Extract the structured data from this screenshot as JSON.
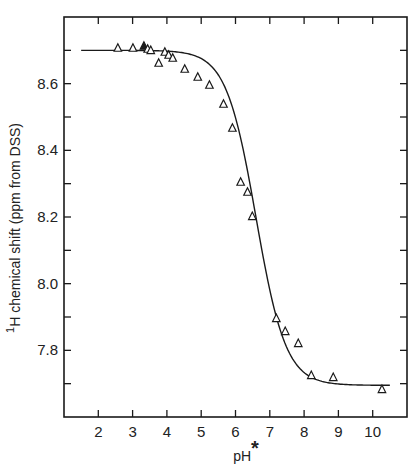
{
  "chart_data": {
    "type": "scatter",
    "title": "",
    "xlabel": "pH",
    "xlabel_superscript": "*",
    "ylabel": "H chemical shift (ppm from DSS)",
    "ylabel_superscript": "1",
    "xlim": [
      1.0,
      11.0
    ],
    "ylim": [
      7.6,
      8.8
    ],
    "x_ticks": [
      2,
      3,
      4,
      5,
      6,
      7,
      8,
      9,
      10
    ],
    "x_tick_labels": [
      "2",
      "3",
      "4",
      "5",
      "6",
      "7",
      "8",
      "9",
      "10"
    ],
    "y_ticks": [
      7.8,
      8.0,
      8.2,
      8.4,
      8.6
    ],
    "y_tick_labels": [
      "7.8",
      "8.0",
      "8.2",
      "8.4",
      "8.6"
    ],
    "y_minor_step": 0.1,
    "grid": false,
    "legend": null,
    "marker": "open-triangle",
    "series": [
      {
        "name": "observed",
        "points": [
          {
            "x": 2.57,
            "y": 8.707
          },
          {
            "x": 3.01,
            "y": 8.707
          },
          {
            "x": 3.33,
            "y": 8.713,
            "filled": true
          },
          {
            "x": 3.44,
            "y": 8.704
          },
          {
            "x": 3.53,
            "y": 8.7
          },
          {
            "x": 3.76,
            "y": 8.662
          },
          {
            "x": 3.94,
            "y": 8.695
          },
          {
            "x": 4.05,
            "y": 8.686
          },
          {
            "x": 4.17,
            "y": 8.677
          },
          {
            "x": 4.52,
            "y": 8.644
          },
          {
            "x": 4.9,
            "y": 8.62
          },
          {
            "x": 5.24,
            "y": 8.596
          },
          {
            "x": 5.65,
            "y": 8.539
          },
          {
            "x": 5.91,
            "y": 8.467
          },
          {
            "x": 6.15,
            "y": 8.305
          },
          {
            "x": 6.35,
            "y": 8.275
          },
          {
            "x": 6.49,
            "y": 8.202
          },
          {
            "x": 7.19,
            "y": 7.896
          },
          {
            "x": 7.45,
            "y": 7.857
          },
          {
            "x": 7.83,
            "y": 7.821
          },
          {
            "x": 8.21,
            "y": 7.725
          },
          {
            "x": 8.85,
            "y": 7.719
          },
          {
            "x": 10.27,
            "y": 7.683
          }
        ]
      }
    ],
    "fit_curve": {
      "name": "titration fit",
      "model": "henderson-hasselbalch",
      "acid_limit": 8.7,
      "base_limit": 7.695,
      "pKa": 6.6,
      "x_range": [
        1.5,
        10.5
      ]
    }
  }
}
